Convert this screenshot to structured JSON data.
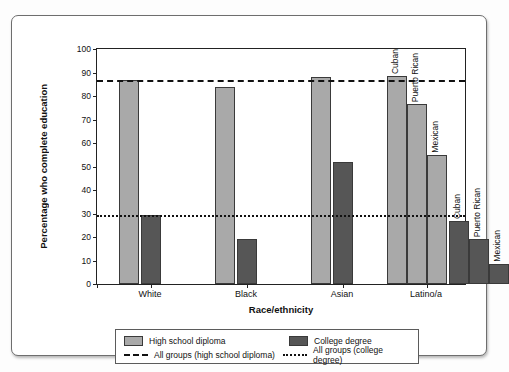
{
  "chart_data": {
    "type": "bar",
    "title": "",
    "xlabel": "Race/ethnicity",
    "ylabel": "Percentage who complete education",
    "ylim": [
      0,
      100
    ],
    "ytick_step": 10,
    "yticks": [
      0,
      10,
      20,
      30,
      40,
      50,
      60,
      70,
      80,
      90,
      100
    ],
    "grid": false,
    "legend_position": "bottom",
    "categories": [
      "White",
      "Black",
      "Asian",
      "Latino/a"
    ],
    "series": [
      {
        "name": "High school diploma",
        "color": "#a9a9a9",
        "values": [
          87,
          84,
          88,
          null
        ],
        "subgroup_values": [
          76.5,
          55
        ]
      },
      {
        "name": "College degree",
        "color": "#565656",
        "values": [
          29.5,
          19,
          52,
          null
        ],
        "subgroup_values": [
          19,
          8.5
        ]
      }
    ],
    "bars": [
      {
        "group": "White",
        "series": "High school diploma",
        "label": "",
        "value": 87,
        "fill": "#a9a9a9"
      },
      {
        "group": "White",
        "series": "College degree",
        "label": "",
        "value": 29.5,
        "fill": "#565656"
      },
      {
        "group": "Black",
        "series": "High school diploma",
        "label": "",
        "value": 84,
        "fill": "#a9a9a9"
      },
      {
        "group": "Black",
        "series": "College degree",
        "label": "",
        "value": 19,
        "fill": "#565656"
      },
      {
        "group": "Asian",
        "series": "High school diploma",
        "label": "",
        "value": 88,
        "fill": "#a9a9a9"
      },
      {
        "group": "Asian",
        "series": "College degree",
        "label": "",
        "value": 52,
        "fill": "#565656"
      },
      {
        "group": "Latino/a",
        "series": "High school diploma",
        "label": "Cuban",
        "value": 88.5,
        "fill": "#a9a9a9"
      },
      {
        "group": "Latino/a",
        "series": "High school diploma",
        "label": "Puerto Rican",
        "value": 76.5,
        "fill": "#a9a9a9"
      },
      {
        "group": "Latino/a",
        "series": "High school diploma",
        "label": "Mexican",
        "value": 55,
        "fill": "#a9a9a9"
      },
      {
        "group": "Latino/a",
        "series": "College degree",
        "label": "Cuban",
        "value": 27,
        "fill": "#565656"
      },
      {
        "group": "Latino/a",
        "series": "College degree",
        "label": "Puerto Rican",
        "value": 19,
        "fill": "#565656"
      },
      {
        "group": "Latino/a",
        "series": "College degree",
        "label": "Mexican",
        "value": 8.5,
        "fill": "#565656"
      }
    ],
    "reference_lines": [
      {
        "name": "All groups (high school diploma)",
        "value": 87,
        "style": "dashed",
        "color": "#111111"
      },
      {
        "name": "All groups (college degree)",
        "value": 29.5,
        "style": "dotted",
        "color": "#111111"
      }
    ],
    "annotations": [
      "Cuban",
      "Puerto Rican",
      "Mexican"
    ]
  },
  "axis": {
    "y_label": "Percentage who complete education",
    "x_label": "Race/ethnicity",
    "y_ticks": [
      "0",
      "10",
      "20",
      "30",
      "40",
      "50",
      "60",
      "70",
      "80",
      "90",
      "100"
    ],
    "x_ticks": [
      "White",
      "Black",
      "Asian",
      "Latino/a"
    ]
  },
  "legend": {
    "hs_label": "High school diploma",
    "college_label": "College degree",
    "hs_line_label": "All groups (high school diploma)",
    "college_line_label": "All groups (college degree)"
  },
  "bar_labels": {
    "hs_cuban": "Cuban",
    "hs_puerto_rican": "Puerto Rican",
    "hs_mexican": "Mexican",
    "col_cuban": "Cuban",
    "col_puerto_rican": "Puerto Rican",
    "col_mexican": "Mexican"
  },
  "colors": {
    "high_school": "#a9a9a9",
    "college": "#565656",
    "axis": "#111111",
    "frame": "#6e6e6e"
  }
}
